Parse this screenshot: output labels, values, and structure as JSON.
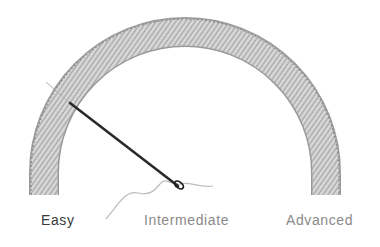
{
  "gauge": {
    "title": "Difficulty",
    "levels": [
      "Easy",
      "Intermediate",
      "Advanced"
    ],
    "selected": "Easy",
    "colors": {
      "arc": "#b5b5b5",
      "arc_dark": "#6e6e6e",
      "needle": "#2a2a2a",
      "thread": "#bdbdbd",
      "label_active": "#3a3a3a",
      "label_inactive": "#8a8a8a"
    }
  }
}
